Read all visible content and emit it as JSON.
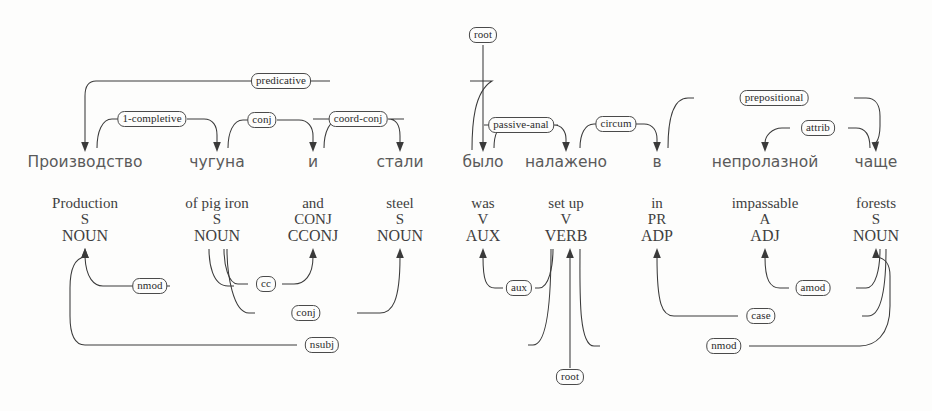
{
  "diagram": {
    "kind": "dependency-parse",
    "title": "",
    "line_color": "#3a3a3a",
    "label_border_color": "#4a4a4a",
    "background_color": "#fdfdfc",
    "source_language": "Russian",
    "gloss_language": "English"
  },
  "tokens": [
    {
      "index": 0,
      "x": 85,
      "source": "Производство",
      "gloss": "Production",
      "pos": "S",
      "upos": "NOUN"
    },
    {
      "index": 1,
      "x": 217,
      "source": "чугуна",
      "gloss": "of pig iron",
      "pos": "S",
      "upos": "NOUN"
    },
    {
      "index": 2,
      "x": 313,
      "source": "и",
      "gloss": "and",
      "pos": "CONJ",
      "upos": "CCONJ"
    },
    {
      "index": 3,
      "x": 400,
      "source": "стали",
      "gloss": "steel",
      "pos": "S",
      "upos": "NOUN"
    },
    {
      "index": 4,
      "x": 483,
      "source": "было",
      "gloss": "was",
      "pos": "V",
      "upos": "AUX"
    },
    {
      "index": 5,
      "x": 566,
      "source": "налажено",
      "gloss": "set up",
      "pos": "V",
      "upos": "VERB"
    },
    {
      "index": 6,
      "x": 657,
      "source": "в",
      "gloss": "in",
      "pos": "PR",
      "upos": "ADP"
    },
    {
      "index": 7,
      "x": 765,
      "source": "непролазной",
      "gloss": "impassable",
      "pos": "A",
      "upos": "ADJ"
    },
    {
      "index": 8,
      "x": 876,
      "source": "чаще",
      "gloss": "forests",
      "pos": "S",
      "upos": "NOUN"
    }
  ],
  "top_relations": [
    {
      "id": "predicative",
      "label": "predicative",
      "head_index": 4,
      "dep_index": 0,
      "label_x": 281,
      "label_y": 81
    },
    {
      "id": "1-completive",
      "label": "1-completive",
      "head_index": 0,
      "dep_index": 1,
      "label_x": 152,
      "label_y": 119
    },
    {
      "id": "conj",
      "label": "conj",
      "head_index": 3,
      "dep_index": 2,
      "label_x": 262,
      "label_y": 120
    },
    {
      "id": "coord-conj",
      "label": "coord-conj",
      "head_index": 1,
      "dep_index": 3,
      "label_x": 358,
      "label_y": 119
    },
    {
      "id": "root-top",
      "label": "root",
      "head_index": null,
      "dep_index": 4,
      "label_x": 483,
      "label_y": 35
    },
    {
      "id": "passive-anal",
      "label": "passive-anal",
      "head_index": 4,
      "dep_index": 5,
      "label_x": 521,
      "label_y": 125
    },
    {
      "id": "circum",
      "label": "circum",
      "head_index": 5,
      "dep_index": 6,
      "label_x": 616,
      "label_y": 124
    },
    {
      "id": "prepositional",
      "label": "prepositional",
      "head_index": 6,
      "dep_index": 8,
      "label_x": 774,
      "label_y": 98
    },
    {
      "id": "attrib",
      "label": "attrib",
      "head_index": 8,
      "dep_index": 7,
      "label_x": 818,
      "label_y": 128
    }
  ],
  "bottom_relations": [
    {
      "id": "nmod-1",
      "label": "nmod",
      "head_index": 1,
      "dep_index": 0,
      "label_x": 150,
      "label_y": 286
    },
    {
      "id": "cc",
      "label": "cc",
      "head_index": 1,
      "dep_index": 2,
      "label_x": 266,
      "label_y": 284
    },
    {
      "id": "conj-b",
      "label": "conj",
      "head_index": 1,
      "dep_index": 3,
      "label_x": 306,
      "label_y": 313
    },
    {
      "id": "nsubj",
      "label": "nsubj",
      "head_index": 0,
      "dep_index": 5,
      "label_x": 322,
      "label_y": 345
    },
    {
      "id": "aux",
      "label": "aux",
      "head_index": 4,
      "dep_index": 5,
      "label_x": 519,
      "label_y": 288
    },
    {
      "id": "root-bottom",
      "label": "root",
      "head_index": null,
      "dep_index": 5,
      "label_x": 570,
      "label_y": 377
    },
    {
      "id": "case",
      "label": "case",
      "head_index": 6,
      "dep_index": 8,
      "label_x": 761,
      "label_y": 316
    },
    {
      "id": "amod",
      "label": "amod",
      "head_index": 7,
      "dep_index": 8,
      "label_x": 813,
      "label_y": 288
    },
    {
      "id": "nmod-2",
      "label": "nmod",
      "head_index": 5,
      "dep_index": 8,
      "label_x": 724,
      "label_y": 346
    }
  ]
}
